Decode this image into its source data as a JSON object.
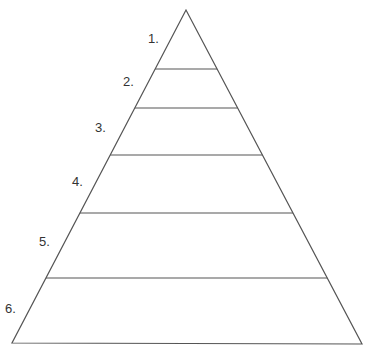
{
  "diagram": {
    "type": "pyramid",
    "levels": [
      {
        "label": "1.",
        "text": ""
      },
      {
        "label": "2.",
        "text": ""
      },
      {
        "label": "3.",
        "text": ""
      },
      {
        "label": "4.",
        "text": ""
      },
      {
        "label": "5.",
        "text": ""
      },
      {
        "label": "6.",
        "text": ""
      }
    ],
    "line_color": "#555555",
    "label_color": "#333333"
  }
}
